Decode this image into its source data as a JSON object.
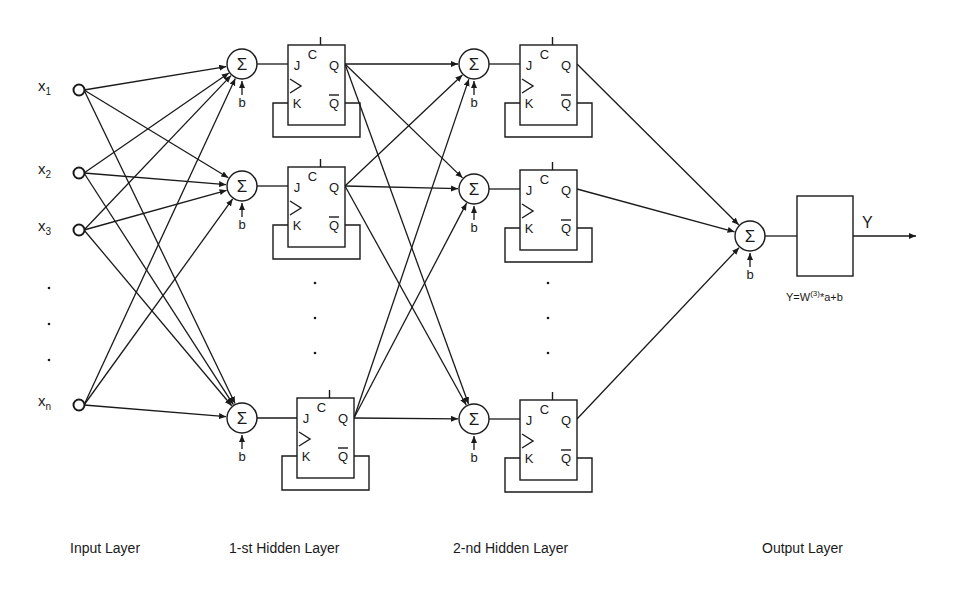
{
  "diagram": {
    "type": "neural-network-with-jk-flipflops",
    "colors": {
      "stroke": "#1a1a1a",
      "background": "#ffffff"
    },
    "inputs": [
      {
        "base": "x",
        "sub": "1",
        "y": 90
      },
      {
        "base": "x",
        "sub": "2",
        "y": 173
      },
      {
        "base": "x",
        "sub": "3",
        "y": 230
      },
      {
        "base": "x",
        "sub": "n",
        "y": 405
      }
    ],
    "input_ellipsis_y": [
      288,
      324,
      360
    ],
    "sum_symbol": "Σ",
    "bias_label": "b",
    "flipflop_labels": {
      "j": "J",
      "k": "K",
      "c": "C",
      "q": "Q",
      "qbar": "Q"
    },
    "layer1": {
      "sum_y": [
        64,
        186,
        418
      ],
      "ellipsis_y": [
        283,
        318,
        353
      ]
    },
    "layer2": {
      "sum_y": [
        64,
        189,
        419
      ],
      "ellipsis_y": [
        283,
        318,
        353
      ]
    },
    "output": {
      "label": "Y",
      "formula_prefix": "Y=W",
      "formula_sup": "(3)",
      "formula_suffix": "*a+b"
    },
    "layer_labels": {
      "input": "Input Layer",
      "hidden1": "1-st Hidden Layer",
      "hidden2": "2-nd Hidden Layer",
      "output": "Output Layer"
    }
  }
}
